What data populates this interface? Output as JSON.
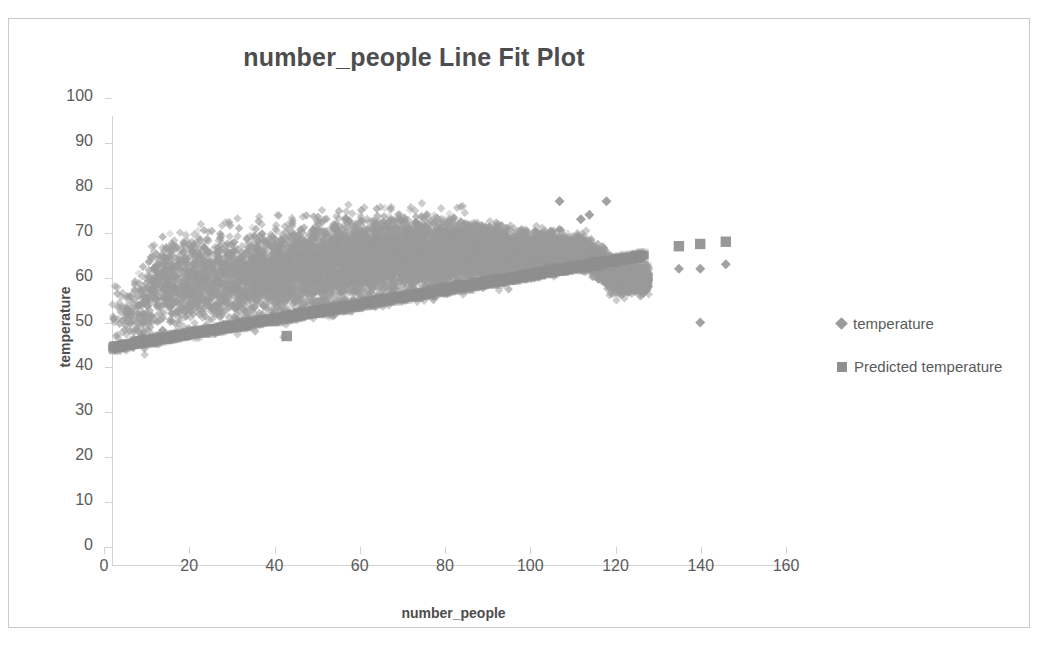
{
  "chart_data": {
    "type": "scatter",
    "title": "number_people Line Fit  Plot",
    "xlabel": "number_people",
    "ylabel": "temperature",
    "xlim": [
      0,
      160
    ],
    "ylim": [
      0,
      100
    ],
    "xticks": [
      0,
      20,
      40,
      60,
      80,
      100,
      120,
      140,
      160
    ],
    "yticks": [
      0,
      10,
      20,
      30,
      40,
      50,
      60,
      70,
      80,
      90,
      100
    ],
    "grid": false,
    "legend_position": "right",
    "series": [
      {
        "name": "temperature",
        "marker": "diamond",
        "color": "#9a9a9a",
        "description": "Dense observed scatter cloud fanning out from x=0 (temperature 38-72) to x=125 (temperature 47-88), with sparse outliers out to x=145.",
        "envelope_upper": [
          {
            "x": 0,
            "y": 72
          },
          {
            "x": 5,
            "y": 73
          },
          {
            "x": 10,
            "y": 84
          },
          {
            "x": 16,
            "y": 86
          },
          {
            "x": 22,
            "y": 86
          },
          {
            "x": 30,
            "y": 85
          },
          {
            "x": 41,
            "y": 87
          },
          {
            "x": 50,
            "y": 88
          },
          {
            "x": 57,
            "y": 88
          },
          {
            "x": 64,
            "y": 88
          },
          {
            "x": 71,
            "y": 87
          },
          {
            "x": 80,
            "y": 85
          },
          {
            "x": 88,
            "y": 83
          },
          {
            "x": 95,
            "y": 80
          },
          {
            "x": 104,
            "y": 79
          },
          {
            "x": 112,
            "y": 76
          },
          {
            "x": 120,
            "y": 72
          },
          {
            "x": 125,
            "y": 70
          }
        ],
        "envelope_lower": [
          {
            "x": 0,
            "y": 38
          },
          {
            "x": 10,
            "y": 40
          },
          {
            "x": 20,
            "y": 41
          },
          {
            "x": 30,
            "y": 43
          },
          {
            "x": 40,
            "y": 44
          },
          {
            "x": 50,
            "y": 46
          },
          {
            "x": 60,
            "y": 49
          },
          {
            "x": 70,
            "y": 51
          },
          {
            "x": 80,
            "y": 54
          },
          {
            "x": 90,
            "y": 57
          },
          {
            "x": 100,
            "y": 60
          },
          {
            "x": 110,
            "y": 63
          },
          {
            "x": 118,
            "y": 56
          },
          {
            "x": 124,
            "y": 57
          }
        ],
        "outliers": [
          {
            "x": 105,
            "y": 81
          },
          {
            "x": 116,
            "y": 81
          },
          {
            "x": 112,
            "y": 78
          },
          {
            "x": 110,
            "y": 77
          },
          {
            "x": 133,
            "y": 66
          },
          {
            "x": 138,
            "y": 66
          },
          {
            "x": 144,
            "y": 67
          },
          {
            "x": 138,
            "y": 54
          }
        ]
      },
      {
        "name": "Predicted temperature",
        "marker": "square",
        "color": "#8f8f8f",
        "description": "Regression fit band running from about (0,48) to (125,69); isolated predicted markers at the far right.",
        "fit_line": [
          {
            "x": 0,
            "y": 48.5
          },
          {
            "x": 125,
            "y": 69.0
          }
        ],
        "slope": 0.164,
        "intercept": 48.5,
        "isolated_points": [
          {
            "x": 133,
            "y": 71
          },
          {
            "x": 138,
            "y": 71.5
          },
          {
            "x": 144,
            "y": 72
          },
          {
            "x": 41,
            "y": 51
          }
        ]
      }
    ]
  },
  "chart": {
    "title": "number_people Line Fit  Plot",
    "x_axis_title": "number_people",
    "y_axis_title": "temperature",
    "x_tick_labels": [
      "0",
      "20",
      "40",
      "60",
      "80",
      "100",
      "120",
      "140",
      "160"
    ],
    "y_tick_labels": [
      "0",
      "10",
      "20",
      "30",
      "40",
      "50",
      "60",
      "70",
      "80",
      "90",
      "100"
    ],
    "legend": [
      {
        "label": "temperature",
        "marker": "diamond-marker-icon",
        "color": "#9a9a9a"
      },
      {
        "label": "Predicted temperature",
        "marker": "square-marker-icon",
        "color": "#8f8f8f"
      }
    ],
    "colors": {
      "title_text": "#4d4d4d",
      "tick_text": "#5a5a5a",
      "axis_line": "#d2d2d2",
      "frame_border": "#c9c9c9",
      "observed_marker": "#9a9a9a",
      "predicted_marker": "#8f8f8f",
      "background": "#ffffff"
    }
  }
}
